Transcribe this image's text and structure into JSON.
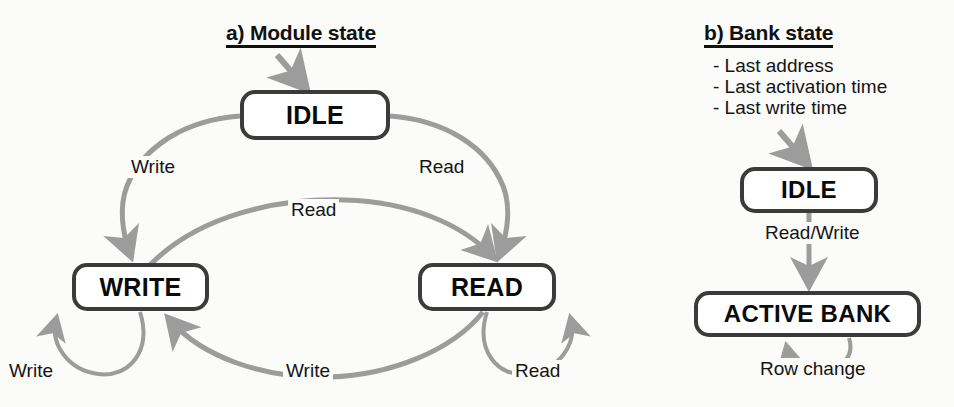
{
  "figure": {
    "background_color": "#fbfbf9",
    "box_border_color": "#3b3b3b",
    "edge_color": "#9c9c9c",
    "text_color": "#0b0b0b"
  },
  "panel_a": {
    "title": "a) Module state",
    "states": {
      "idle": "IDLE",
      "write": "WRITE",
      "read": "READ"
    },
    "transitions": {
      "start_to_idle": "",
      "idle_to_write": "Write",
      "idle_to_read": "Read",
      "write_to_read": "Read",
      "read_to_write": "Write",
      "write_self": "Write",
      "read_self": "Read"
    }
  },
  "panel_b": {
    "title": "b) Bank state",
    "notes": [
      "- Last address",
      "- Last activation time",
      "- Last write time"
    ],
    "states": {
      "idle": "IDLE",
      "active_bank": "ACTIVE BANK"
    },
    "transitions": {
      "start_to_idle": "",
      "idle_to_active": "Read/Write",
      "active_self": "Row change"
    }
  }
}
